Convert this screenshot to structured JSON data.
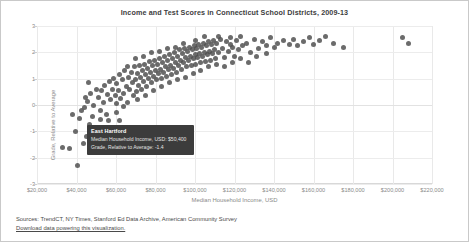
{
  "chart_data": {
    "type": "scatter",
    "title": "Income and Test Scores in Connecticut School Districts, 2009-13",
    "xlabel": "Median Household Income, USD",
    "ylabel": "Grade, Relative to Average",
    "xlim": [
      20000,
      220000
    ],
    "ylim": [
      -3,
      3
    ],
    "xticks": [
      20000,
      40000,
      60000,
      80000,
      100000,
      120000,
      140000,
      160000,
      180000,
      200000,
      220000
    ],
    "xticklabels": [
      "$20,000",
      "$40,000",
      "$60,000",
      "$80,000",
      "$100,000",
      "$120,000",
      "$140,000",
      "$160,000",
      "$180,000",
      "$200,000",
      "$220,000"
    ],
    "yticks": [
      3,
      2,
      1,
      0,
      -1,
      -2,
      -3
    ],
    "yticklabels": [
      "3",
      "2",
      "1",
      "0",
      "-1",
      "-2",
      "-3"
    ],
    "grid": true,
    "legend": false,
    "marker_color": "#4b4b4b",
    "points": [
      [
        33000,
        -1.6
      ],
      [
        36500,
        -1.65
      ],
      [
        38000,
        -0.35
      ],
      [
        39500,
        -1.0
      ],
      [
        40500,
        -2.3
      ],
      [
        41500,
        -0.5
      ],
      [
        42500,
        -0.2
      ],
      [
        43500,
        -1.45
      ],
      [
        44000,
        -0.1
      ],
      [
        45000,
        -1.2
      ],
      [
        45500,
        0.15
      ],
      [
        46500,
        -0.75
      ],
      [
        47000,
        0.45
      ],
      [
        48000,
        -0.45
      ],
      [
        48500,
        0.0
      ],
      [
        49500,
        -1.5
      ],
      [
        50400,
        -1.4
      ],
      [
        51000,
        0.3
      ],
      [
        52000,
        -0.2
      ],
      [
        52500,
        0.55
      ],
      [
        53500,
        0.1
      ],
      [
        54000,
        0.75
      ],
      [
        55000,
        -0.35
      ],
      [
        55500,
        0.4
      ],
      [
        56500,
        0.9
      ],
      [
        57000,
        0.2
      ],
      [
        58000,
        0.6
      ],
      [
        58500,
        1.0
      ],
      [
        59500,
        0.35
      ],
      [
        60000,
        0.8
      ],
      [
        60500,
        -0.3
      ],
      [
        61500,
        0.55
      ],
      [
        62000,
        1.15
      ],
      [
        62500,
        0.25
      ],
      [
        63500,
        0.95
      ],
      [
        64000,
        0.45
      ],
      [
        64500,
        1.3
      ],
      [
        65500,
        0.7
      ],
      [
        66000,
        0.1
      ],
      [
        66500,
        1.05
      ],
      [
        67000,
        0.6
      ],
      [
        68000,
        1.25
      ],
      [
        68500,
        0.85
      ],
      [
        69000,
        0.35
      ],
      [
        69500,
        1.45
      ],
      [
        70000,
        0.95
      ],
      [
        70500,
        0.5
      ],
      [
        71000,
        1.2
      ],
      [
        71500,
        0.75
      ],
      [
        72000,
        1.5
      ],
      [
        72500,
        1.05
      ],
      [
        73000,
        0.6
      ],
      [
        73500,
        1.3
      ],
      [
        74000,
        0.9
      ],
      [
        74500,
        1.55
      ],
      [
        75000,
        1.15
      ],
      [
        75500,
        0.7
      ],
      [
        76000,
        1.4
      ],
      [
        76500,
        1.0
      ],
      [
        77000,
        1.65
      ],
      [
        77500,
        1.25
      ],
      [
        78000,
        0.85
      ],
      [
        78500,
        1.5
      ],
      [
        79000,
        1.1
      ],
      [
        79500,
        1.7
      ],
      [
        80000,
        1.3
      ],
      [
        80500,
        0.95
      ],
      [
        81000,
        1.55
      ],
      [
        81500,
        1.2
      ],
      [
        82000,
        1.75
      ],
      [
        82500,
        1.35
      ],
      [
        83000,
        1.0
      ],
      [
        83500,
        1.6
      ],
      [
        84000,
        1.25
      ],
      [
        84500,
        1.85
      ],
      [
        85000,
        1.45
      ],
      [
        85500,
        1.1
      ],
      [
        86000,
        1.7
      ],
      [
        86500,
        1.35
      ],
      [
        87000,
        1.9
      ],
      [
        87500,
        1.5
      ],
      [
        88000,
        1.15
      ],
      [
        88500,
        1.75
      ],
      [
        89000,
        1.4
      ],
      [
        89500,
        2.0
      ],
      [
        90000,
        1.6
      ],
      [
        90500,
        1.25
      ],
      [
        91000,
        1.85
      ],
      [
        91500,
        1.5
      ],
      [
        92000,
        2.1
      ],
      [
        92500,
        1.7
      ],
      [
        93000,
        1.35
      ],
      [
        93500,
        1.95
      ],
      [
        94000,
        1.6
      ],
      [
        94500,
        2.15
      ],
      [
        95000,
        1.8
      ],
      [
        95500,
        1.45
      ],
      [
        96000,
        2.05
      ],
      [
        96500,
        1.7
      ],
      [
        97000,
        2.2
      ],
      [
        97500,
        1.85
      ],
      [
        98000,
        1.5
      ],
      [
        98500,
        2.1
      ],
      [
        99000,
        1.75
      ],
      [
        99500,
        2.25
      ],
      [
        100000,
        1.9
      ],
      [
        100500,
        1.55
      ],
      [
        101000,
        2.15
      ],
      [
        101500,
        1.8
      ],
      [
        102000,
        2.3
      ],
      [
        102500,
        1.95
      ],
      [
        103000,
        1.6
      ],
      [
        103500,
        2.2
      ],
      [
        104000,
        1.85
      ],
      [
        104500,
        2.35
      ],
      [
        105000,
        2.0
      ],
      [
        105500,
        1.65
      ],
      [
        106000,
        2.25
      ],
      [
        106500,
        1.9
      ],
      [
        107000,
        2.4
      ],
      [
        107500,
        2.05
      ],
      [
        108000,
        1.7
      ],
      [
        108500,
        2.3
      ],
      [
        109000,
        1.95
      ],
      [
        109500,
        2.45
      ],
      [
        110000,
        2.1
      ],
      [
        110500,
        1.75
      ],
      [
        111000,
        2.35
      ],
      [
        112000,
        2.0
      ],
      [
        113000,
        2.5
      ],
      [
        114000,
        2.15
      ],
      [
        115000,
        1.8
      ],
      [
        116000,
        2.4
      ],
      [
        117000,
        2.05
      ],
      [
        118000,
        2.55
      ],
      [
        119000,
        2.2
      ],
      [
        120000,
        1.85
      ],
      [
        121000,
        2.45
      ],
      [
        122000,
        2.1
      ],
      [
        123000,
        2.6
      ],
      [
        124000,
        2.25
      ],
      [
        126000,
        2.35
      ],
      [
        128000,
        2.0
      ],
      [
        130000,
        2.5
      ],
      [
        132000,
        2.15
      ],
      [
        134000,
        2.4
      ],
      [
        136000,
        2.25
      ],
      [
        138000,
        2.55
      ],
      [
        140000,
        2.2
      ],
      [
        142000,
        2.35
      ],
      [
        145000,
        2.45
      ],
      [
        148000,
        2.3
      ],
      [
        150000,
        2.5
      ],
      [
        152000,
        2.25
      ],
      [
        155000,
        2.4
      ],
      [
        158000,
        2.55
      ],
      [
        160000,
        2.3
      ],
      [
        163000,
        2.45
      ],
      [
        166000,
        2.6
      ],
      [
        170000,
        2.35
      ],
      [
        175000,
        2.2
      ],
      [
        205000,
        2.55
      ],
      [
        208000,
        2.35
      ],
      [
        62000,
        -0.6
      ],
      [
        58000,
        -0.9
      ],
      [
        54000,
        -1.1
      ],
      [
        50000,
        0.6
      ],
      [
        46000,
        0.85
      ],
      [
        66000,
        1.45
      ],
      [
        70000,
        1.75
      ],
      [
        74000,
        1.85
      ],
      [
        78000,
        2.0
      ],
      [
        82000,
        2.05
      ],
      [
        86000,
        2.15
      ],
      [
        90000,
        2.2
      ],
      [
        94000,
        2.35
      ],
      [
        100000,
        2.45
      ],
      [
        105000,
        2.6
      ],
      [
        112000,
        2.6
      ],
      [
        118000,
        2.3
      ],
      [
        64000,
        -0.05
      ],
      [
        60000,
        0.05
      ],
      [
        56000,
        -0.6
      ],
      [
        52000,
        -0.55
      ],
      [
        48000,
        -1.05
      ],
      [
        44500,
        0.3
      ],
      [
        71000,
        0.2
      ],
      [
        75000,
        0.35
      ],
      [
        79000,
        0.55
      ],
      [
        83000,
        0.7
      ],
      [
        87000,
        0.85
      ],
      [
        91000,
        0.95
      ],
      [
        95000,
        1.05
      ],
      [
        99000,
        1.2
      ],
      [
        103000,
        1.3
      ],
      [
        107000,
        1.45
      ],
      [
        111000,
        1.55
      ],
      [
        115000,
        1.45
      ],
      [
        119000,
        1.6
      ],
      [
        123000,
        1.75
      ],
      [
        127000,
        1.6
      ],
      [
        131000,
        1.85
      ],
      [
        136000,
        1.95
      ]
    ],
    "highlighted_point": {
      "name": "East Hartford",
      "income": 50400,
      "grade": -1.4
    }
  },
  "tooltip": {
    "title": "East Hartford",
    "row1": "Median Household Income, USD: $50,400",
    "row2": "Grade, Relative to Average: -1.4"
  },
  "footer": {
    "sources": "Sources: TrendCT, NY Times, Stanford Ed Data Archive, American Community Survey",
    "download_link": "Download data powering this visualization."
  }
}
